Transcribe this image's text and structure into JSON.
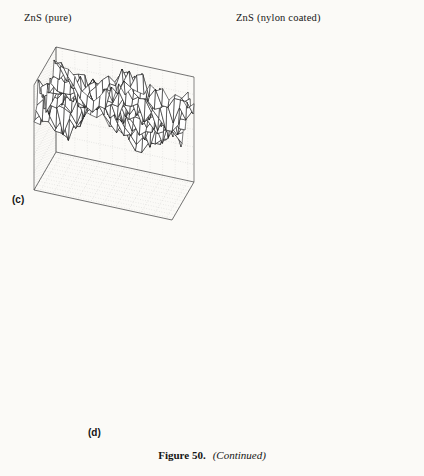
{
  "figure": {
    "number_label": "Figure 50.",
    "continued_label": "(Continued)",
    "panel_c_label": "(c)",
    "panel_d_label": "(d)"
  },
  "chart_data": [
    {
      "type": "surface",
      "panel": "(c)",
      "position": "left",
      "title": "ZnS (pure)",
      "zlabel": "Intensity",
      "xlabel": "X Direction",
      "ylabel": "Y Direction",
      "zticks": [
        0,
        500,
        1000,
        1500,
        2000,
        2500,
        3000,
        3500
      ],
      "xticks": [
        2,
        4,
        6,
        8,
        10
      ],
      "yticks": [
        2,
        4,
        6,
        8,
        10
      ],
      "zlim": [
        0,
        3500
      ],
      "xlim": [
        0,
        10
      ],
      "ylim": [
        0,
        10
      ],
      "grid": true,
      "mesh_style": "wireframe",
      "surface_mean_intensity": 2600,
      "surface_roughness_amplitude": 420,
      "description": "Rough wireframe surface, large peak-to-valley variation around a mean near 2600 counts"
    },
    {
      "type": "surface",
      "panel": "(c)",
      "position": "right",
      "title": "ZnS  (nylon coated)",
      "zlabel": "Intensity",
      "xlabel": "X Direction",
      "ylabel": "Y Direction",
      "zticks": [
        0,
        500,
        1000,
        1500,
        2000,
        2500,
        3000,
        3500
      ],
      "xticks": [
        2,
        4,
        6,
        8,
        10
      ],
      "yticks": [
        2,
        4,
        6,
        8,
        10
      ],
      "zlim": [
        0,
        3500
      ],
      "xlim": [
        0,
        10
      ],
      "ylim": [
        0,
        10
      ],
      "grid": true,
      "mesh_style": "wireframe",
      "surface_mean_intensity": 2550,
      "surface_roughness_amplitude": 160,
      "description": "Smoother, denser wireframe surface with much smaller height variation than the pure sample"
    },
    {
      "type": "bar",
      "panel": "(d)",
      "title": "",
      "ylabel": "Surface Roughness",
      "xlabel": "",
      "categories": [
        "Si",
        "CaF2",
        "ZnS",
        "ZnSe(⊥)",
        "ZnSe(II)1",
        "ZnSe(II)"
      ],
      "category_labels_display": [
        "Si",
        "CaF₂",
        "ZnS",
        "ZnSe(⊥)",
        "ZnSe(II)₁",
        "ZnSe(II)"
      ],
      "values": [
        0.0,
        0.09,
        0.12,
        0.08,
        1.18,
        0.03
      ],
      "yticks": [
        0.0,
        0.2,
        0.4,
        0.6,
        0.8,
        1.0,
        1.2
      ],
      "ylim": [
        0.0,
        1.3
      ],
      "grid": true,
      "grid_style": "dotted",
      "bar_color": "#1c1c1c",
      "projection": "3d"
    }
  ]
}
